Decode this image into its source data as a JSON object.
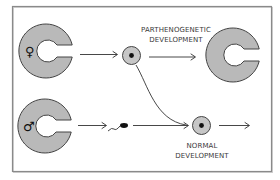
{
  "diagram": {
    "title": "",
    "colors": {
      "frame": "#8a8a8a",
      "embryo_fill": "#b9b9b9",
      "outline": "#444444",
      "text": "#3a3a3a"
    },
    "nodes": {
      "female_embryo": {
        "symbol": "♀",
        "label": "female"
      },
      "male_embryo": {
        "symbol": "♂",
        "label": "male"
      },
      "egg_cell": {
        "label": "egg"
      },
      "sperm": {
        "label": "sperm"
      },
      "parthenogenetic_result": {
        "label": "embryo"
      },
      "fertilized_egg": {
        "label": "zygote"
      }
    },
    "labels": {
      "parthenogenetic_line1": "PARTHENOGENETIC",
      "parthenogenetic_line2": "DEVELOPMENT",
      "normal_line1": "NORMAL",
      "normal_line2": "DEVELOPMENT"
    }
  }
}
